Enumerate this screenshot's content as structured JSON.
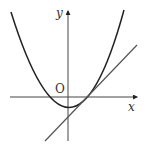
{
  "diagram": {
    "type": "coordinate-graph",
    "labels": {
      "y_axis": "y",
      "x_axis": "x",
      "origin": "O"
    },
    "curves": [
      {
        "name": "parabola",
        "description": "upward-opening parabola, vertex slightly below origin to the right, crossing x-axis on both sides of origin"
      },
      {
        "name": "tangent-line",
        "description": "straight line with positive slope, tangent to parabola at its right x-intercept, crossing y-axis below origin"
      }
    ],
    "colors": {
      "stroke": "#222222",
      "line": "#555555",
      "background": "#ffffff"
    }
  }
}
